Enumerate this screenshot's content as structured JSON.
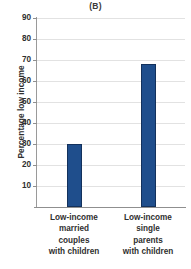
{
  "chart_data": {
    "type": "bar",
    "title": "(B)",
    "xlabel": "",
    "ylabel": "Percentage low income",
    "categories": [
      "Low-income married couples with children",
      "Low-income single parents with children"
    ],
    "category_lines": [
      [
        "Low-income",
        "married",
        "couples",
        "with children"
      ],
      [
        "Low-income",
        "single",
        "parents",
        "with children"
      ]
    ],
    "values": [
      30,
      68
    ],
    "ylim": [
      0,
      90
    ],
    "yticks": [
      90,
      80,
      70,
      60,
      50,
      40,
      30,
      20,
      10
    ],
    "ytick_labels": [
      "90",
      "80",
      "70",
      "60",
      "50",
      "40",
      "30",
      "20",
      "10"
    ],
    "grid": true,
    "legend": "none",
    "bar_color": "#1f4e8c",
    "bar_edge_color": "#13315c",
    "gridline_color": "#e2e2e2",
    "axis_color": "#8f8f8f",
    "text_color": "#2f2f2f",
    "background": "#ffffff"
  }
}
